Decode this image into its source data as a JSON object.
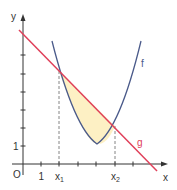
{
  "diagram": {
    "axes": {
      "x_label": "x",
      "y_label": "y",
      "origin_label": "O",
      "x_unit_label": "1",
      "y_unit_label": "1"
    },
    "points": {
      "x1": {
        "label": "x",
        "sub": "1"
      },
      "x2": {
        "label": "x",
        "sub": "2"
      }
    },
    "curves": {
      "f": {
        "label": "f",
        "type": "parabola",
        "color": "#4a5a8a"
      },
      "g": {
        "label": "g",
        "type": "line",
        "color": "#e0405a"
      }
    },
    "region": {
      "description": "area between g and f from x1 to x2",
      "color": "#fdf0c4"
    }
  }
}
